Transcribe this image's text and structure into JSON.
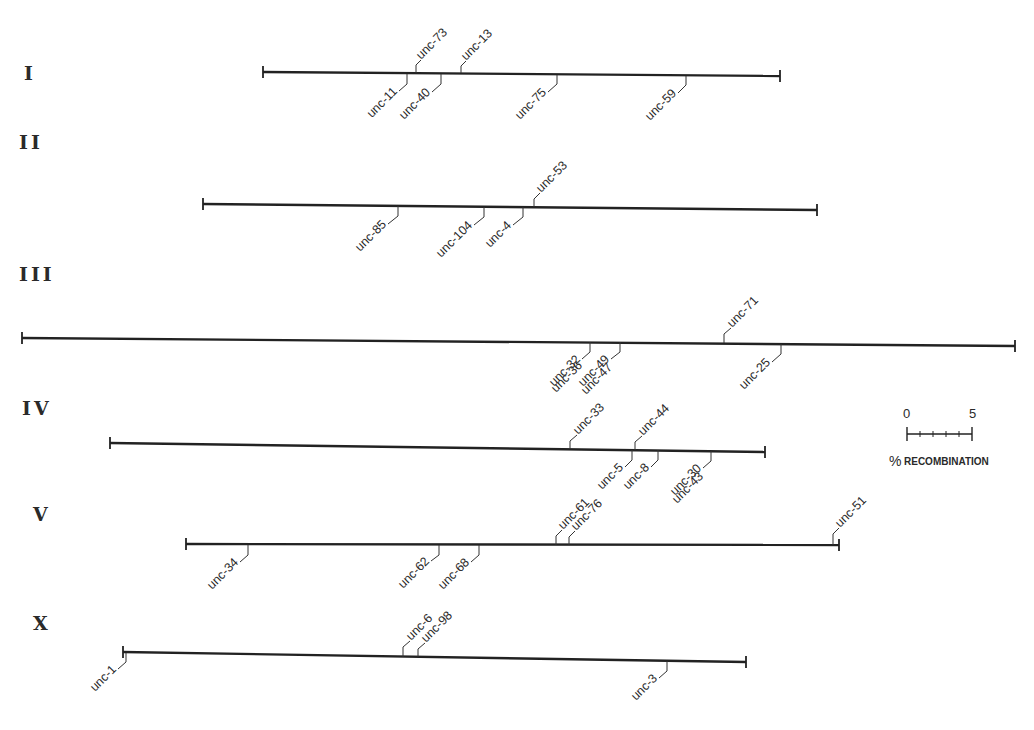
{
  "figure": {
    "type": "genetic-linkage-map",
    "scale_bar": {
      "min_label": "0",
      "max_label": "5",
      "unit_symbol": "%",
      "unit_label": "RECOMBINATION",
      "minor_ticks": 5
    },
    "chromosomes": [
      {
        "name": "I",
        "label_pos": [
          22,
          78
        ],
        "line": [
          263,
          72,
          780,
          76
        ],
        "genes": [
          {
            "name": "unc-73",
            "x": 416,
            "side": "above"
          },
          {
            "name": "unc-13",
            "x": 461,
            "side": "above"
          },
          {
            "name": "unc-11",
            "x": 407,
            "side": "below"
          },
          {
            "name": "unc-40",
            "x": 441,
            "side": "below"
          },
          {
            "name": "unc-75",
            "x": 557,
            "side": "below"
          },
          {
            "name": "unc-59",
            "x": 686,
            "side": "below"
          }
        ]
      },
      {
        "name": "II",
        "label_pos": [
          18,
          147
        ],
        "line": [
          203,
          204,
          817,
          210
        ],
        "genes": [
          {
            "name": "unc-53",
            "x": 534,
            "side": "above"
          },
          {
            "name": "unc-85",
            "x": 398,
            "side": "below"
          },
          {
            "name": "unc-104",
            "x": 484,
            "side": "below"
          },
          {
            "name": "unc-4",
            "x": 523,
            "side": "below"
          }
        ]
      },
      {
        "name": "III",
        "label_pos": [
          19,
          278
        ],
        "line": [
          22,
          338,
          1015,
          346
        ],
        "genes": [
          {
            "name": "unc-71",
            "x": 724,
            "side": "above"
          },
          {
            "name": "unc-32",
            "x": 590,
            "side": "below"
          },
          {
            "name": "unc-36",
            "x": 590,
            "side": "below"
          },
          {
            "name": "unc-49",
            "x": 620,
            "side": "below"
          },
          {
            "name": "unc-47",
            "x": 620,
            "side": "below"
          },
          {
            "name": "unc-25",
            "x": 781,
            "side": "below"
          }
        ]
      },
      {
        "name": "IV",
        "label_pos": [
          22,
          413
        ],
        "line": [
          110,
          443,
          765,
          452
        ],
        "genes": [
          {
            "name": "unc-33",
            "x": 570,
            "side": "above"
          },
          {
            "name": "unc-44",
            "x": 635,
            "side": "above"
          },
          {
            "name": "unc-5",
            "x": 632,
            "side": "below"
          },
          {
            "name": "unc-8",
            "x": 658,
            "side": "below"
          },
          {
            "name": "unc-30",
            "x": 711,
            "side": "below"
          },
          {
            "name": "unc-43",
            "x": 711,
            "side": "below"
          }
        ]
      },
      {
        "name": "V",
        "label_pos": [
          33,
          518
        ],
        "line": [
          186,
          544,
          839,
          545
        ],
        "genes": [
          {
            "name": "unc-61",
            "x": 556,
            "side": "above"
          },
          {
            "name": "unc-76",
            "x": 569,
            "side": "above"
          },
          {
            "name": "unc-51",
            "x": 833,
            "side": "above"
          },
          {
            "name": "unc-34",
            "x": 248,
            "side": "below"
          },
          {
            "name": "unc-62",
            "x": 439,
            "side": "below"
          },
          {
            "name": "unc-68",
            "x": 479,
            "side": "below"
          }
        ]
      },
      {
        "name": "X",
        "label_pos": [
          33,
          627
        ],
        "line": [
          123,
          652,
          746,
          662
        ],
        "genes": [
          {
            "name": "unc-6",
            "x": 403,
            "side": "above"
          },
          {
            "name": "unc-98",
            "x": 418,
            "side": "above"
          },
          {
            "name": "unc-1",
            "x": 126,
            "side": "below"
          },
          {
            "name": "unc-3",
            "x": 667,
            "side": "below"
          }
        ]
      }
    ]
  },
  "labels": {
    "chromosomes": [
      "I",
      "II",
      "III",
      "IV",
      "V",
      "X"
    ],
    "scale_min": "0",
    "scale_max": "5",
    "scale_unit_symbol": "%",
    "scale_unit": "RECOMBINATION",
    "genes": {
      "c1": [
        "unc-73",
        "unc-13",
        "unc-11",
        "unc-40",
        "unc-75",
        "unc-59"
      ],
      "c2": [
        "unc-53",
        "unc-85",
        "unc-104",
        "unc-4"
      ],
      "c3": [
        "unc-71",
        "unc-32",
        "unc-36",
        "unc-49",
        "unc-47",
        "unc-25"
      ],
      "c4": [
        "unc-33",
        "unc-44",
        "unc-5",
        "unc-8",
        "unc-30",
        "unc-43"
      ],
      "c5": [
        "unc-61",
        "unc-76",
        "unc-51",
        "unc-34",
        "unc-62",
        "unc-68"
      ],
      "cx": [
        "unc-6",
        "unc-98",
        "unc-1",
        "unc-3"
      ]
    }
  }
}
